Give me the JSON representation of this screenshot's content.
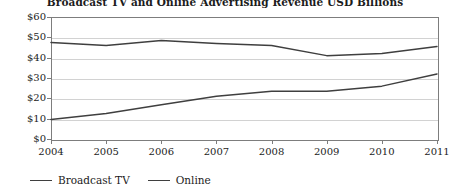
{
  "chart_data": {
    "type": "line",
    "title": "Broadcast TV and Online Advertising Revenue USD Billions",
    "xlabel": "",
    "ylabel": "",
    "categories": [
      "2004",
      "2005",
      "2006",
      "2007",
      "2008",
      "2009",
      "2010",
      "2011"
    ],
    "x": [
      2004,
      2005,
      2006,
      2007,
      2008,
      2009,
      2010,
      2011
    ],
    "series": [
      {
        "name": "Broadcast TV",
        "color": "#3f3f3f",
        "values": [
          47.5,
          46.0,
          48.5,
          47.0,
          46.0,
          41.0,
          42.0,
          45.5
        ]
      },
      {
        "name": "Online",
        "color": "#3f3f3f",
        "values": [
          9.6,
          12.5,
          16.9,
          21.0,
          23.5,
          23.5,
          26.0,
          32.0
        ]
      }
    ],
    "ylim": [
      0,
      60
    ],
    "yticks": [
      0,
      10,
      20,
      30,
      40,
      50,
      60
    ],
    "ytick_labels": [
      "$0",
      "$10",
      "$20",
      "$30",
      "$40",
      "$50",
      "$60"
    ],
    "grid": true,
    "grid_axis": "y",
    "legend_position": "bottom-left",
    "legend_entries": [
      "Broadcast TV",
      "Online"
    ],
    "annotations": []
  },
  "colors": {
    "line": "#3f3f3f",
    "gridline": "#d2d2d2",
    "axis": "#7d7d7d",
    "text": "#1c1c1c",
    "background": "#ffffff"
  }
}
